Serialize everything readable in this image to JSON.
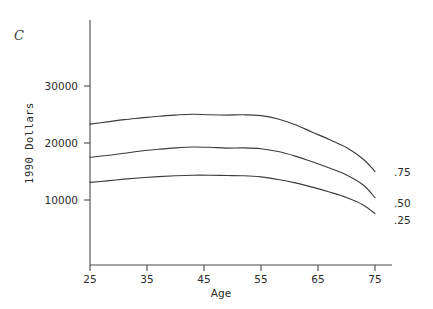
{
  "panel": {
    "label": "C"
  },
  "chart_data": {
    "type": "line",
    "title": "",
    "subtitle": "",
    "panel_label": "C",
    "xlabel": "Age",
    "ylabel": "1990 Dollars",
    "xlim": [
      25,
      77
    ],
    "ylim": [
      3500,
      33000
    ],
    "xticks": [
      25,
      35,
      45,
      55,
      65,
      75
    ],
    "xtick_labels": [
      "25",
      "35",
      "45",
      "55",
      "65",
      "75"
    ],
    "yticks": [
      10000,
      20000,
      30000
    ],
    "ytick_labels": [
      "10000",
      "20000",
      "30000"
    ],
    "grid": false,
    "legend_position": "right-inline-end-of-line",
    "line_color": "#3c3c3c",
    "background_color": "#ffffff",
    "x": [
      25,
      28,
      31,
      34,
      37,
      40,
      43,
      46,
      49,
      52,
      55,
      58,
      61,
      64,
      67,
      70,
      73,
      75
    ],
    "series": [
      {
        "name": ".75",
        "label": ".75",
        "values": [
          23300,
          23700,
          24100,
          24400,
          24700,
          24900,
          25050,
          24950,
          24900,
          24950,
          24800,
          24200,
          23200,
          21900,
          20600,
          19200,
          17100,
          15000
        ]
      },
      {
        "name": ".50",
        "label": ".50",
        "values": [
          17500,
          17800,
          18200,
          18600,
          18900,
          19150,
          19300,
          19250,
          19100,
          19150,
          19000,
          18500,
          17700,
          16700,
          15600,
          14400,
          12600,
          10400
        ]
      },
      {
        "name": ".25",
        "label": ".25",
        "values": [
          13100,
          13350,
          13650,
          13900,
          14100,
          14250,
          14350,
          14350,
          14300,
          14250,
          14050,
          13600,
          13000,
          12250,
          11400,
          10450,
          9100,
          7600
        ]
      }
    ]
  }
}
